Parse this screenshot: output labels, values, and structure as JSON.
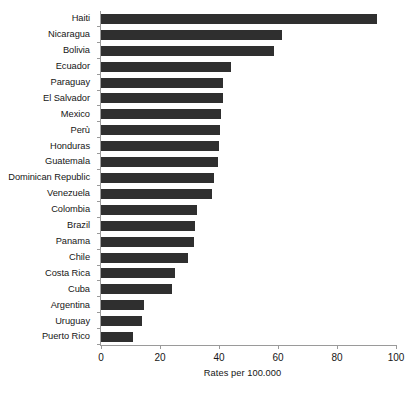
{
  "chart_data": {
    "type": "bar",
    "orientation": "horizontal",
    "title": "",
    "xlabel": "Rates per 100.000",
    "ylabel": "",
    "xlim": [
      0,
      100
    ],
    "xticks": [
      0,
      20,
      40,
      60,
      80,
      100
    ],
    "grid": false,
    "legend": null,
    "bar_color": "#2f2f2f",
    "axis_color": "#9a9a9a",
    "categories": [
      "Haiti",
      "Nicaragua",
      "Bolivia",
      "Ecuador",
      "Paraguay",
      "El Salvador",
      "Mexico",
      "Perù",
      "Honduras",
      "Guatemala",
      "Dominican Republic",
      "Venezuela",
      "Colombia",
      "Brazil",
      "Panama",
      "Chile",
      "Costa Rica",
      "Cuba",
      "Argentina",
      "Uruguay",
      "Puerto Rico"
    ],
    "values": [
      93.5,
      61.5,
      58.5,
      44.0,
      41.5,
      41.5,
      40.8,
      40.3,
      40.0,
      39.6,
      38.3,
      37.5,
      32.5,
      31.8,
      31.5,
      29.5,
      25.0,
      24.0,
      14.6,
      13.9,
      10.8
    ]
  }
}
